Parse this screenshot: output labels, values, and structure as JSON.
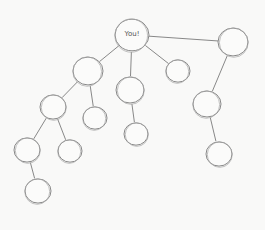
{
  "diagram": {
    "type": "hand-drawn tree",
    "root_label": "You!",
    "nodes": [
      {
        "id": "root",
        "label": "You!",
        "x": 132,
        "y": 35,
        "r": 17
      },
      {
        "id": "n1",
        "label": "",
        "x": 233,
        "y": 42,
        "r": 15
      },
      {
        "id": "n2",
        "label": "",
        "x": 88,
        "y": 71,
        "r": 15
      },
      {
        "id": "n3",
        "label": "",
        "x": 130,
        "y": 90,
        "r": 14
      },
      {
        "id": "n4",
        "label": "",
        "x": 178,
        "y": 71,
        "r": 12
      },
      {
        "id": "n5",
        "label": "",
        "x": 53,
        "y": 107,
        "r": 13
      },
      {
        "id": "n6",
        "label": "",
        "x": 95,
        "y": 118,
        "r": 12
      },
      {
        "id": "n7",
        "label": "",
        "x": 136,
        "y": 134,
        "r": 12
      },
      {
        "id": "n8",
        "label": "",
        "x": 207,
        "y": 104,
        "r": 14
      },
      {
        "id": "n9",
        "label": "",
        "x": 27,
        "y": 150,
        "r": 13
      },
      {
        "id": "n10",
        "label": "",
        "x": 70,
        "y": 151,
        "r": 12
      },
      {
        "id": "n11",
        "label": "",
        "x": 219,
        "y": 154,
        "r": 13
      },
      {
        "id": "n12",
        "label": "",
        "x": 38,
        "y": 191,
        "r": 13
      }
    ],
    "edges": [
      [
        "root",
        "n1"
      ],
      [
        "root",
        "n2"
      ],
      [
        "root",
        "n3"
      ],
      [
        "root",
        "n4"
      ],
      [
        "n2",
        "n5"
      ],
      [
        "n2",
        "n6"
      ],
      [
        "n3",
        "n7"
      ],
      [
        "n1",
        "n8"
      ],
      [
        "n5",
        "n9"
      ],
      [
        "n5",
        "n10"
      ],
      [
        "n8",
        "n11"
      ],
      [
        "n9",
        "n12"
      ]
    ]
  }
}
